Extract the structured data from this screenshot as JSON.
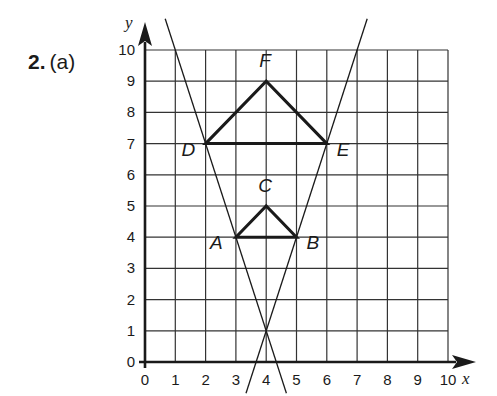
{
  "question": {
    "number": "2.",
    "part": "(a)"
  },
  "axes": {
    "x_label": "x",
    "y_label": "y",
    "x_ticks": [
      "0",
      "1",
      "2",
      "3",
      "4",
      "5",
      "6",
      "7",
      "8",
      "9",
      "10"
    ],
    "y_ticks": [
      "0",
      "1",
      "2",
      "3",
      "4",
      "5",
      "6",
      "7",
      "8",
      "9",
      "10"
    ],
    "x_range": [
      0,
      10
    ],
    "y_range": [
      0,
      10
    ],
    "grid": true
  },
  "points": {
    "A": {
      "label": "A",
      "x": 3,
      "y": 4
    },
    "B": {
      "label": "B",
      "x": 5,
      "y": 4
    },
    "C": {
      "label": "C",
      "x": 4,
      "y": 5
    },
    "D": {
      "label": "D",
      "x": 2,
      "y": 7
    },
    "E": {
      "label": "E",
      "x": 6,
      "y": 7
    },
    "F": {
      "label": "F",
      "x": 4,
      "y": 9
    }
  },
  "shapes": {
    "small_triangle": [
      "A",
      "B",
      "C"
    ],
    "large_triangle": [
      "D",
      "E",
      "F"
    ]
  },
  "construction_lines": {
    "center_of_enlargement": {
      "x": 4,
      "y": 1
    },
    "line_1": {
      "through": [
        "D",
        "A",
        "center"
      ]
    },
    "line_2": {
      "through": [
        "E",
        "B",
        "center"
      ]
    }
  },
  "colors": {
    "ink": "#1a1a1a",
    "background": "#ffffff"
  }
}
